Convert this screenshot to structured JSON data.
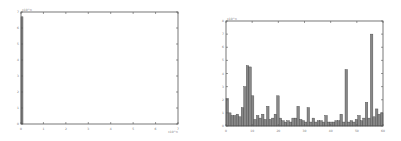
{
  "chart_data": [
    {
      "type": "bar",
      "title": "",
      "xlabel": "",
      "ylabel": "",
      "x_exponent_label": "x10^n",
      "y_exponent_label": "x10^n",
      "xticks": [
        "0",
        "1",
        "2",
        "3",
        "4",
        "5",
        "6",
        "7"
      ],
      "yticks": [
        "0",
        "1",
        "2",
        "3",
        "4",
        "5",
        "6",
        "7"
      ],
      "xlim": [
        0,
        7
      ],
      "ylim": [
        0,
        7
      ],
      "grid": false,
      "categories": [
        "bin1"
      ],
      "values": [
        6.7
      ],
      "bar_color": "#888888"
    },
    {
      "type": "bar",
      "title": "",
      "xlabel": "",
      "ylabel": "",
      "y_exponent_label": "x10^n",
      "xticks": [
        "0",
        "10",
        "20",
        "30",
        "40",
        "50",
        "60"
      ],
      "yticks": [
        "0",
        "1",
        "2",
        "3",
        "4",
        "5",
        "6",
        "7",
        "8"
      ],
      "ylim": [
        0,
        8
      ],
      "grid": false,
      "bar_color": "#888888",
      "values": [
        2.1,
        1.0,
        0.8,
        0.8,
        0.9,
        0.7,
        1.4,
        3.0,
        4.6,
        4.5,
        2.3,
        0.5,
        0.8,
        0.6,
        0.9,
        0.5,
        1.5,
        0.5,
        0.6,
        0.9,
        2.3,
        0.6,
        0.4,
        0.3,
        0.4,
        0.3,
        0.6,
        0.6,
        1.5,
        0.5,
        0.4,
        0.3,
        1.4,
        0.3,
        0.6,
        0.3,
        0.4,
        0.4,
        0.3,
        0.8,
        0.3,
        0.3,
        0.3,
        0.4,
        0.4,
        0.9,
        0.3,
        4.3,
        0.3,
        0.4,
        0.3,
        0.5,
        0.8,
        0.4,
        0.6,
        1.8,
        0.6,
        7.0,
        0.7,
        1.3,
        0.9,
        1.0
      ]
    }
  ]
}
